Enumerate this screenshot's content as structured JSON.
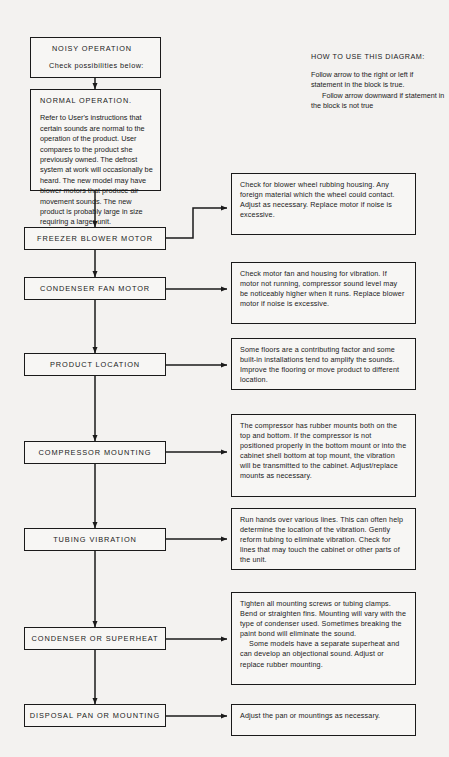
{
  "legend": {
    "title": "HOW TO USE THIS DIAGRAM:",
    "line1": "Follow arrow to the right or left if statement in the block is true.",
    "line2": "Follow arrow downward if statement in the block is not true"
  },
  "start": {
    "title": "NOISY OPERATION",
    "subtitle": "Check possibilities below:"
  },
  "normal": {
    "title": "NORMAL OPERATION.",
    "body": "Refer to User's instructions that certain sounds are normal to the operation of the product. User compares to the product she previously owned. The defrost system at work will occasionally be heard. The new model may have blower motors that produce air movement sounds. The new product is probably large in size requiring a larger unit."
  },
  "nodes": [
    {
      "label": "FREEZER BLOWER MOTOR"
    },
    {
      "label": "CONDENSER FAN MOTOR"
    },
    {
      "label": "PRODUCT LOCATION"
    },
    {
      "label": "COMPRESSOR MOUNTING"
    },
    {
      "label": "TUBING VIBRATION"
    },
    {
      "label": "CONDENSER OR SUPERHEAT"
    },
    {
      "label": "DISPOSAL PAN OR MOUNTING"
    }
  ],
  "details": [
    {
      "p1": "Check for blower wheel rubbing housing. Any foreign material which the wheel could contact. Adjust as necessary. Replace motor if noise is excessive.",
      "p2": ""
    },
    {
      "p1": "Check motor fan and housing for vibration. If motor not running, compressor sound level may be noticeably higher when it runs. Replace blower motor if noise is excessive.",
      "p2": ""
    },
    {
      "p1": "Some floors are a contributing factor and some built-in installations tend to amplify the sounds. Improve the flooring or move product to different location.",
      "p2": ""
    },
    {
      "p1": "The compressor has rubber mounts both on the top and bottom. If the compressor is not positioned properly in the bottom mount or into the cabinet shell bottom at top mount, the vibration will be transmitted to the cabinet. Adjust/replace mounts as necessary.",
      "p2": ""
    },
    {
      "p1": "Run hands over various lines. This can often help determine the location of the vibration. Gently reform tubing to eliminate vibration. Check for lines that may touch the cabinet or other parts of the unit.",
      "p2": ""
    },
    {
      "p1": "Tighten all mounting screws or tubing clamps. Bend or straighten fins. Mounting will vary with the type of condenser used. Sometimes breaking the paint bond will eliminate the sound.",
      "p2": "Some models have a separate superheat and can develop an objectional sound. Adjust or replace rubber mounting."
    },
    {
      "p1": "Adjust the pan or mountings as necessary.",
      "p2": ""
    }
  ],
  "colors": {
    "ink": "#1a1a1a",
    "page": "#f3f2f0",
    "boxfill": "#f7f6f4"
  }
}
